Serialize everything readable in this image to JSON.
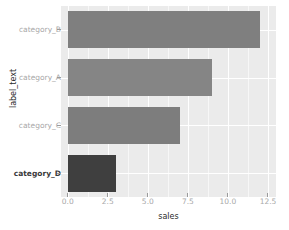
{
  "chart_data": {
    "type": "bar",
    "orientation": "horizontal",
    "title": "",
    "xlabel": "sales",
    "ylabel": "label_text",
    "categories": [
      "category_D",
      "category_C",
      "category_A",
      "category_B"
    ],
    "values": [
      3,
      7,
      9,
      12
    ],
    "bars": [
      {
        "category": "category_B",
        "value": 12,
        "color": "#7f7f7f",
        "highlight": false
      },
      {
        "category": "category_A",
        "value": 9,
        "color": "#858585",
        "highlight": false
      },
      {
        "category": "category_C",
        "value": 7,
        "color": "#7d7d7d",
        "highlight": false
      },
      {
        "category": "category_D",
        "value": 3,
        "color": "#3f3f3f",
        "highlight": true
      }
    ],
    "xlim": [
      -0.42,
      13.0
    ],
    "xticks": [
      "0.0",
      "2.5",
      "5.0",
      "7.5",
      "10.0",
      "12.5"
    ],
    "xtick_values": [
      0.0,
      2.5,
      5.0,
      7.5,
      10.0,
      12.5
    ],
    "yticks": [
      "category_B",
      "category_A",
      "category_C",
      "category_D"
    ],
    "grid": true,
    "legend": "none",
    "panel_background": "#ebebeb",
    "grid_color": "#ffffff",
    "highlight_color": "#3f3f3f",
    "base_color": "#808080",
    "axis_text_color": "#a8a8a8",
    "axis_title_color": "#2b2b2b"
  }
}
